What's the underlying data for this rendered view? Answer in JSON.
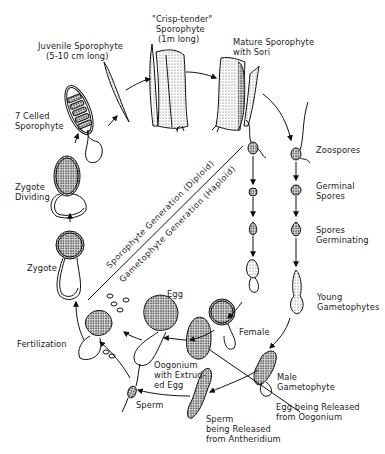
{
  "diagram": {
    "type": "life-cycle",
    "divider": {
      "upper": "Sporophyte Generation (Diploid)",
      "lower": "Gametophyte Generation (Haploid)"
    },
    "labels": {
      "crisp_tender": [
        "\"Crisp-tender\"",
        "Sporophyte",
        "(1m long)"
      ],
      "juvenile": [
        "Juvenile Sporophyte",
        "(5-10 cm long)"
      ],
      "mature": [
        "Mature Sporophyte",
        "with Sori"
      ],
      "seven_celled": [
        "7 Celled",
        "Sporophyte"
      ],
      "zygote_dividing": [
        "Zygote",
        "Dividing"
      ],
      "zygote": [
        "Zygote"
      ],
      "zoospores": [
        "Zoospores"
      ],
      "germinal_spores": [
        "Germinal",
        "Spores"
      ],
      "spores_germinating": [
        "Spores",
        "Germinating"
      ],
      "young_gametophytes": [
        "Young",
        "Gametophytes"
      ],
      "egg": [
        "Egg"
      ],
      "fertilization": [
        "Fertilization"
      ],
      "female": [
        "Female"
      ],
      "oogonium": [
        "Oogonium",
        "with Extrud-",
        "ed Egg"
      ],
      "male_gametophyte": [
        "Male",
        "Gametophyte"
      ],
      "sperm": [
        "Sperm"
      ],
      "egg_released": [
        "Egg being Released",
        "from Oogonium"
      ],
      "sperm_released": [
        "Sperm",
        "being Released",
        "from Antheridium"
      ]
    },
    "stages_sequence": [
      "Zygote",
      "Zygote Dividing",
      "7 Celled Sporophyte",
      "Juvenile Sporophyte (5-10 cm long)",
      "\"Crisp-tender\" Sporophyte (1m long)",
      "Mature Sporophyte with Sori",
      "Zoospores",
      "Germinal Spores",
      "Spores Germinating",
      "Young Gametophytes",
      "Male Gametophyte / Female",
      "Sperm being Released from Antheridium / Egg being Released from Oogonium",
      "Oogonium with Extruded Egg",
      "Fertilization",
      "Zygote"
    ]
  }
}
